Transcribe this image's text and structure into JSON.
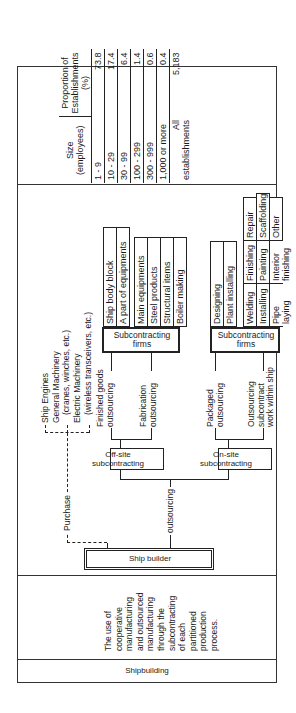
{
  "title": "Shipbuilding",
  "description": [
    "The use of",
    "cooperative",
    "manufacturing",
    "and outsourced",
    "manufacturing",
    "through the",
    "subcontracting",
    "of each",
    "partitioned",
    "production",
    "process."
  ],
  "diagram": {
    "ship_builder": "Ship builder",
    "outsourcing": "outsourcing",
    "purchase": "Purchase",
    "purchased_items": [
      "Ship Engines",
      "General Machinery",
      "(cranes, winches, etc.)",
      "Electric Machinery",
      "(wireless transceivers, etc.)"
    ],
    "off_site": {
      "label_1": "Off-site",
      "label_2": "subcontracting"
    },
    "on_site": {
      "label_1": "On-site",
      "label_2": "subcontracting"
    },
    "finished_goods": {
      "l1": "Finished goods",
      "l2": "outsourcing"
    },
    "fabrication": {
      "l1": "Fabrication",
      "l2": "outsourcing"
    },
    "packaged": {
      "l1": "Packaged",
      "l2": "outsourcing"
    },
    "outsourcing_sub": {
      "l1": "Outsourcing",
      "l2": "subcontract",
      "l3": "work within ship"
    },
    "subcontracting_firms": {
      "l1": "Subcontracting",
      "l2": "firms"
    },
    "finished_items": [
      "Ship body block",
      "A part of equipments"
    ],
    "fabrication_items": [
      "Main equipments",
      "Steel products",
      "Structural items",
      "Boiler making"
    ],
    "packaged_items": [
      "Designing",
      "Plant installing"
    ],
    "onsite_grid": [
      [
        "Welding",
        "Finishing",
        "Repair"
      ],
      [
        "Installing",
        "Painting",
        "Scaffolding"
      ],
      [
        "Pipe laying",
        "Interior finishing",
        "Other"
      ]
    ]
  },
  "table": {
    "headers": [
      [
        "Size",
        "(employees)"
      ],
      [
        "Proportion of",
        "Establishments (%)"
      ]
    ],
    "rows": [
      {
        "size": "1 - 9",
        "value": "73.8"
      },
      {
        "size": "10 - 29",
        "value": "17.4"
      },
      {
        "size": "30 - 99",
        "value": "6.4"
      },
      {
        "size": "100 - 299",
        "value": "1.4"
      },
      {
        "size": "300 - 999",
        "value": "0.6"
      },
      {
        "size": "1,000 or more",
        "value": "0.4"
      }
    ],
    "total": {
      "l1": "All",
      "l2": "establishments",
      "value": "5,183"
    }
  }
}
